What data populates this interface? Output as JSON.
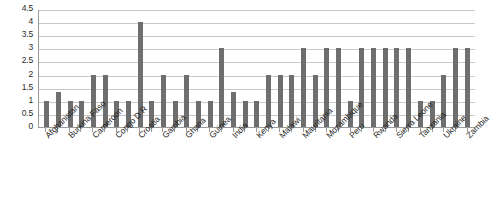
{
  "chart_data": {
    "type": "bar",
    "title": "",
    "subtitle": "",
    "xlabel": "",
    "ylabel": "",
    "ylim": [
      0,
      4.5
    ],
    "yticks": [
      0,
      0.5,
      1,
      1.5,
      2,
      2.5,
      3,
      3.5,
      4,
      4.5
    ],
    "ytick_labels": [
      "0",
      "0.5",
      "1",
      "1.5",
      "2",
      "2.5",
      "3",
      "3.5",
      "4",
      "4.5"
    ],
    "grid": "horizontal",
    "legend": "none",
    "series_color": "#6e6e6e",
    "bar_count": 31,
    "categories": [
      "Afghanistan",
      "",
      "Burkina Faso",
      "",
      "Cameroon",
      "",
      "Congo D R",
      "",
      "Croatia",
      "",
      "Gambia",
      "",
      "Ghana",
      "",
      "Guinea",
      "",
      "India",
      "",
      "Kenya",
      "",
      "Malawi",
      "",
      "Mauritania",
      "",
      "Mozambique",
      "",
      "Peru",
      "",
      "Rwanda",
      "",
      "Sierra Leone",
      "",
      "Tanzania",
      "",
      "Ukraine",
      "",
      "Zambia"
    ],
    "visible_tick_labels": [
      "Afghanistan",
      "Burkina Faso",
      "Cameroon",
      "Congo D R",
      "Croatia",
      "Gambia",
      "Ghana",
      "Guinea",
      "India",
      "Kenya",
      "Malawi",
      "Mauritania",
      "Mozambique",
      "Peru",
      "Rwanda",
      "Sierra Leone",
      "Tanzania",
      "Ukraine",
      "Zambia"
    ],
    "values": [
      1,
      1.33,
      1,
      1,
      2,
      2,
      1,
      1,
      4,
      1,
      2,
      1,
      2,
      1,
      1,
      3,
      1.33,
      1,
      1,
      2,
      2,
      2,
      3,
      2,
      3,
      3,
      1,
      3,
      3,
      3,
      3,
      3,
      1,
      1,
      2,
      3,
      3
    ]
  }
}
